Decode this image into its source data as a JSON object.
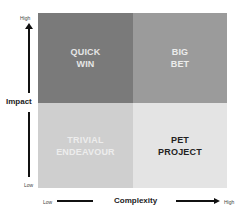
{
  "diagram": {
    "type": "2x2 matrix",
    "y_axis": {
      "title": "Impact",
      "high_label": "High",
      "low_label": "Low"
    },
    "x_axis": {
      "title": "Complexity",
      "low_label": "Low",
      "high_label": "High"
    },
    "quadrants": {
      "top_left": {
        "label": "QUICK\nWIN",
        "bg": "#7a7a7a",
        "fg": "#e6e6e6"
      },
      "top_right": {
        "label": "BIG\nBET",
        "bg": "#9b9b9b",
        "fg": "#ececec"
      },
      "bottom_left": {
        "label": "TRIVIAL\nENDEAVOUR",
        "bg": "#cfcfcf",
        "fg": "#ededed"
      },
      "bottom_right": {
        "label": "PET\nPROJECT",
        "bg": "#e4e4e4",
        "fg": "#222222"
      }
    }
  }
}
